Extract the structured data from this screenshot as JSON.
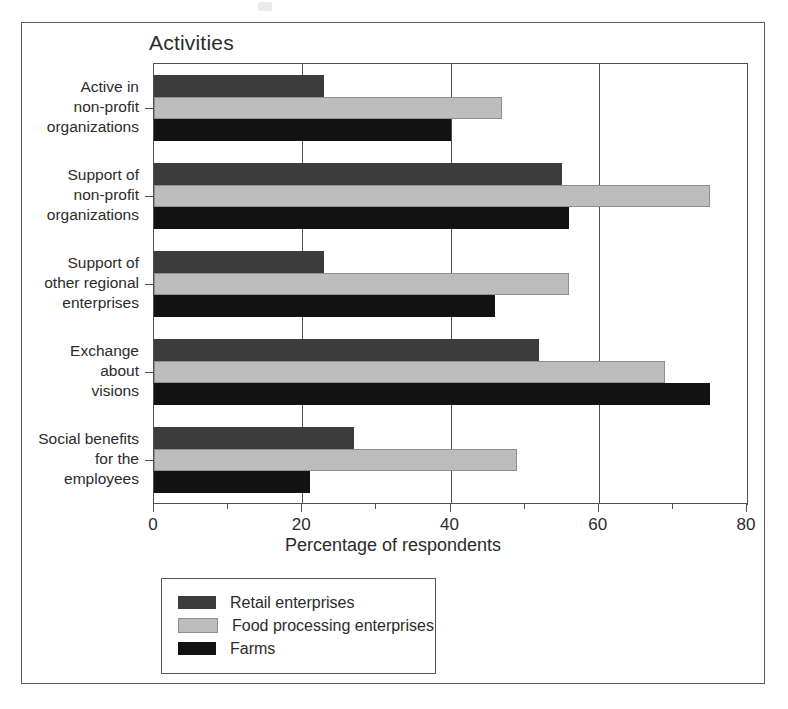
{
  "figure": {
    "title": "Activities"
  },
  "chart_data": {
    "type": "bar",
    "orientation": "horizontal",
    "title": "Activities",
    "xlabel": "Percentage of respondents",
    "ylabel": "",
    "xlim": [
      0,
      80
    ],
    "xticks": [
      0,
      20,
      40,
      60,
      80
    ],
    "xtick_labels": [
      "0",
      "20",
      "40",
      "60",
      "80"
    ],
    "minor_tick_interval": 10,
    "grid": true,
    "grid_axis": "x",
    "legend_position": "below-plot-left",
    "categories": [
      "Active in non-profit organizations",
      "Support of non-profit organizations",
      "Support of other regional enterprises",
      "Exchange about visions",
      "Social benefits for the employees"
    ],
    "category_label_lines": [
      "Active in\nnon-profit\norganizations",
      "Support of\nnon-profit\norganizations",
      "Support of\nother regional\nenterprises",
      "Exchange\nabout\nvisions",
      "Social benefits\nfor the\nemployees"
    ],
    "series": [
      {
        "name": "Retail enterprises",
        "color": "#3c3c3c",
        "values": [
          23,
          55,
          23,
          52,
          27
        ]
      },
      {
        "name": "Food processing enterprises",
        "color": "#bdbdbd",
        "values": [
          47,
          75,
          56,
          69,
          49
        ]
      },
      {
        "name": "Farms",
        "color": "#121212",
        "values": [
          40,
          56,
          46,
          75,
          21
        ]
      }
    ]
  }
}
